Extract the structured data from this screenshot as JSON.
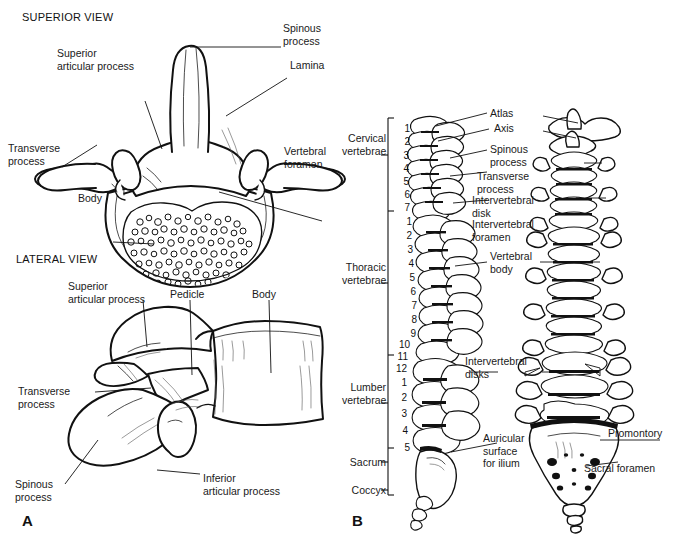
{
  "figure": {
    "title_superior": "SUPERIOR VIEW",
    "title_lateral": "LATERAL VIEW",
    "panel_a": "A",
    "panel_b": "B",
    "ink_color": "#111111",
    "background_color": "#ffffff"
  },
  "superior_view": {
    "labels": [
      {
        "id": "spinous-process",
        "text": "Spinous\nprocess"
      },
      {
        "id": "lamina",
        "text": "Lamina"
      },
      {
        "id": "superior-articular-process",
        "text": "Superior\narticular process"
      },
      {
        "id": "transverse-process",
        "text": "Transverse\nprocess"
      },
      {
        "id": "body",
        "text": "Body"
      },
      {
        "id": "vertebral-foramen",
        "text": "Vertebral\nforamen"
      }
    ]
  },
  "lateral_view": {
    "labels": [
      {
        "id": "superior-articular-process",
        "text": "Superior\narticular process"
      },
      {
        "id": "pedicle",
        "text": "Pedicle"
      },
      {
        "id": "body",
        "text": "Body"
      },
      {
        "id": "transverse-process",
        "text": "Transverse\nprocess"
      },
      {
        "id": "spinous-process",
        "text": "Spinous\nprocess"
      },
      {
        "id": "inferior-articular-process",
        "text": "Inferior\narticular process"
      }
    ]
  },
  "spinal_column": {
    "regions": [
      {
        "id": "cervical",
        "text": "Cervical\nvertebrae"
      },
      {
        "id": "thoracic",
        "text": "Thoracic\nvertebrae"
      },
      {
        "id": "lumbar",
        "text": "Lumber\nvertebrae"
      },
      {
        "id": "sacrum",
        "text": "Sacrum"
      },
      {
        "id": "coccyx",
        "text": "Coccyx"
      }
    ],
    "cervical_numbers": [
      "1",
      "2",
      "3",
      "4",
      "5",
      "6",
      "7"
    ],
    "thoracic_numbers": [
      "1",
      "2",
      "3",
      "4",
      "5",
      "6",
      "7",
      "8",
      "9",
      "10",
      "11",
      "12"
    ],
    "lumbar_numbers": [
      "1",
      "2",
      "3",
      "4",
      "5"
    ],
    "callouts": [
      {
        "id": "atlas",
        "text": "Atlas"
      },
      {
        "id": "axis",
        "text": "Axis"
      },
      {
        "id": "spinous-process",
        "text": "Spinous\nprocess"
      },
      {
        "id": "transverse-process",
        "text": "Transverse\nprocess"
      },
      {
        "id": "intervertebral-disk",
        "text": "Intervertebral\ndisk"
      },
      {
        "id": "intervertebral-foramen",
        "text": "Intervertebral\nforamen"
      },
      {
        "id": "vertebral-body",
        "text": "Vertebral\nbody"
      },
      {
        "id": "intervertebral-disks",
        "text": "Intervertebral\ndisks"
      },
      {
        "id": "auricular-surface",
        "text": "Auricular\nsurface\nfor ilium"
      },
      {
        "id": "promontory",
        "text": "Promontory"
      },
      {
        "id": "sacral-foramen",
        "text": "Sacral foramen"
      }
    ]
  }
}
